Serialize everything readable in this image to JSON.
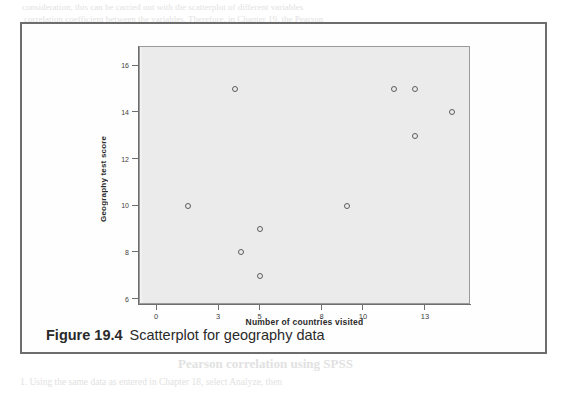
{
  "figure": {
    "caption_number": "Figure 19.4",
    "caption_text": "Scatterplot for geography data"
  },
  "colors": {
    "plot_background": "#ebebeb",
    "plot_border": "#9a9a9a",
    "axis": "#6e6e6e",
    "marker": "#5c5c5c",
    "figure_border": "#6d6d6d",
    "page_background": "#ffffff",
    "bleed_text": "#c9c9c9"
  },
  "chart_data": {
    "type": "scatter",
    "title": "",
    "xlabel": "Number of countries visited",
    "ylabel": "Geography test score",
    "xlim": [
      -0.8,
      15.2
    ],
    "ylim": [
      5.75,
      16.8
    ],
    "xticks": [
      0,
      3,
      5,
      8,
      10,
      13
    ],
    "yticks": [
      6,
      8,
      10,
      12,
      14,
      16
    ],
    "xtick_labels": [
      "0",
      "3",
      "5",
      "8",
      "10",
      "13"
    ],
    "ytick_labels": [
      "6",
      "8",
      "10",
      "12",
      "14",
      "16"
    ],
    "grid": false,
    "legend": false,
    "marker": "open-circle",
    "series": [
      {
        "name": "Students",
        "x": [
          1.5,
          3.8,
          4.1,
          5.0,
          5.0,
          9.2,
          11.5,
          12.5,
          12.5,
          14.3
        ],
        "y": [
          10,
          15,
          8,
          9,
          7,
          10,
          15,
          15,
          13,
          14
        ]
      }
    ],
    "points": [
      {
        "x": 1.5,
        "y": 10
      },
      {
        "x": 3.8,
        "y": 15
      },
      {
        "x": 4.1,
        "y": 8
      },
      {
        "x": 5.0,
        "y": 9
      },
      {
        "x": 5.0,
        "y": 7
      },
      {
        "x": 9.2,
        "y": 10
      },
      {
        "x": 11.5,
        "y": 15
      },
      {
        "x": 12.5,
        "y": 15
      },
      {
        "x": 12.5,
        "y": 13
      },
      {
        "x": 14.3,
        "y": 14
      }
    ]
  },
  "background_bleed": [
    {
      "text": "consideration, this can be carried out with the scatterplot of different variables",
      "x": 22,
      "y": 2,
      "size": 9,
      "weight": "normal"
    },
    {
      "text": "correlation coefficient between the variables. Therefore, in Chapter 19, the Pearson",
      "x": 24,
      "y": 14,
      "size": 9,
      "weight": "normal"
    },
    {
      "text": "correlation coefficient analysis was used to establish the significance of the relationship",
      "x": 26,
      "y": 30,
      "size": 9,
      "weight": "normal"
    },
    {
      "text": "the variables under study.",
      "x": 210,
      "y": 44,
      "size": 9,
      "weight": "normal"
    },
    {
      "text": "As seen in",
      "x": 318,
      "y": 73,
      "size": 9.5,
      "weight": "normal"
    },
    {
      "text": "one of the scatterplot",
      "x": 326,
      "y": 88,
      "size": 9.5,
      "weight": "normal"
    },
    {
      "text": "to the regression line",
      "x": 330,
      "y": 103,
      "size": 9.5,
      "weight": "normal"
    },
    {
      "text": "the test and the strength of the relationship between the",
      "x": 208,
      "y": 133,
      "size": 9.5,
      "weight": "normal"
    },
    {
      "text": "number of countries",
      "x": 300,
      "y": 148,
      "size": 9.5,
      "weight": "normal"
    },
    {
      "text": "of the Pearson correlation",
      "x": 200,
      "y": 172,
      "size": 13,
      "weight": "bold"
    },
    {
      "text": "Now that the relationship is seen in the scatterplot, the next step you",
      "x": 194,
      "y": 196,
      "size": 9.5,
      "weight": "normal"
    },
    {
      "text": "interpret them is to find the degree of relationship. From your data",
      "x": 198,
      "y": 211,
      "size": 9.5,
      "weight": "normal"
    },
    {
      "text": "by determining whether the relationship is statistically significant",
      "x": 200,
      "y": 226,
      "size": 9.5,
      "weight": "normal"
    },
    {
      "text": "correlation coefficient.",
      "x": 226,
      "y": 241,
      "size": 9.5,
      "weight": "normal"
    },
    {
      "text": "Pearson correlation using SPSS",
      "x": 178,
      "y": 356,
      "size": 13,
      "weight": "bold"
    },
    {
      "text": "1. Using the same data as entered in Chapter 18, select Analyze, then",
      "x": 20,
      "y": 377,
      "size": 9.5,
      "weight": "normal"
    }
  ]
}
